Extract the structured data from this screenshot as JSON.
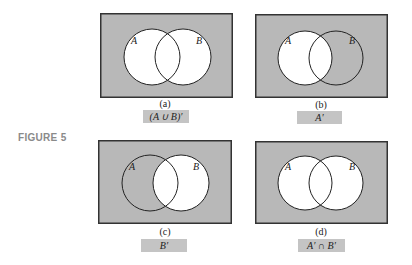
{
  "figure_label": "FIGURE 5",
  "colors": {
    "shade": "#b8b8b8",
    "white": "#ffffff",
    "stroke": "#222222",
    "label_bg": "#c4c4c4"
  },
  "panels": [
    {
      "id": "a",
      "caption": "(a)",
      "expression": "(A ∪ B)′",
      "set_a_label": "A",
      "set_b_label": "B",
      "shaded": "outside A∪B"
    },
    {
      "id": "b",
      "caption": "(b)",
      "expression": "A′",
      "set_a_label": "A",
      "set_b_label": "B",
      "shaded": "outside A"
    },
    {
      "id": "c",
      "caption": "(c)",
      "expression": "B′",
      "set_a_label": "A",
      "set_b_label": "B",
      "shaded": "outside B"
    },
    {
      "id": "d",
      "caption": "(d)",
      "expression": "A′ ∩ B′",
      "set_a_label": "A",
      "set_b_label": "B",
      "shaded": "outside A∪B"
    }
  ]
}
